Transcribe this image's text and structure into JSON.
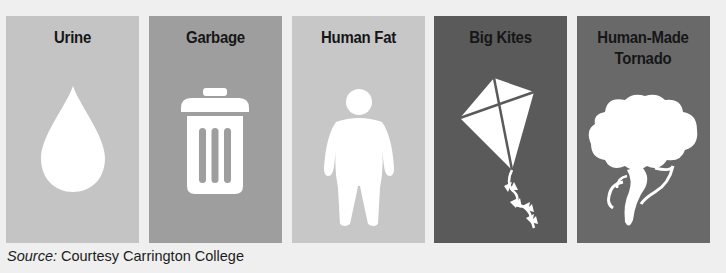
{
  "panels": [
    {
      "label": "Urine",
      "icon": "water-drop-icon",
      "bg": "#c4c4c4"
    },
    {
      "label": "Garbage",
      "icon": "trash-can-icon",
      "bg": "#9e9e9e"
    },
    {
      "label": "Human Fat",
      "icon": "person-icon",
      "bg": "#c7c7c7"
    },
    {
      "label": "Big Kites",
      "icon": "kite-icon",
      "bg": "#5a5a5a"
    },
    {
      "label": "Human-Made Tornado",
      "icon": "tornado-icon",
      "bg": "#696969"
    }
  ],
  "source": {
    "prefix": "Source:",
    "text": " Courtesy Carrington College"
  }
}
